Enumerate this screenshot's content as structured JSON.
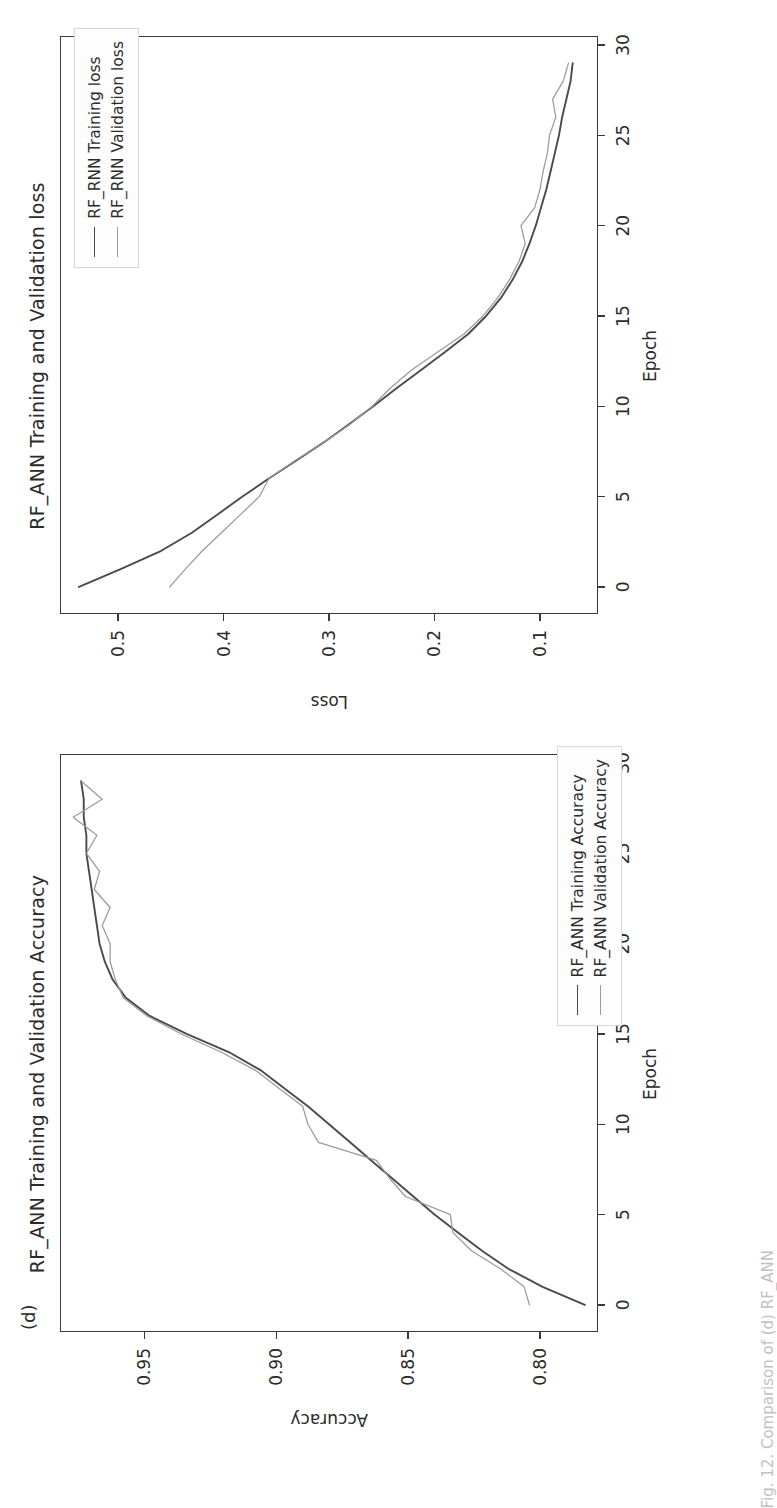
{
  "figure": {
    "subfigure_letter": "(d)",
    "caption_fragment": "Fig. 12. Comparison of (d) RF_ANN"
  },
  "colors": {
    "train": "#4a4a4a",
    "validation": "#9a9a9a",
    "axis": "#3a3a3a",
    "text": "#2b2b2b",
    "legend_border": "#d9d9d9",
    "background": "#ffffff"
  },
  "charts": [
    {
      "id": "loss",
      "title": "RF_ANN Training and Validation loss",
      "xlabel": "Epoch",
      "ylabel": "Loss",
      "xticks": [
        0,
        5,
        10,
        15,
        20,
        25,
        30
      ],
      "yticks": [
        0.5,
        0.4,
        0.3,
        0.2,
        0.1
      ],
      "legend": [
        {
          "label": "RF_RNN Training loss",
          "color": "#4a4a4a"
        },
        {
          "label": "RF_RNN Validation loss",
          "color": "#9a9a9a"
        }
      ]
    },
    {
      "id": "accuracy",
      "title": "RF_ANN Training and Validation Accuracy",
      "xlabel": "Epoch",
      "ylabel": "Accuracy",
      "xticks": [
        0,
        5,
        10,
        15,
        20,
        25,
        30
      ],
      "yticks": [
        0.95,
        0.9,
        0.85,
        0.8
      ],
      "legend": [
        {
          "label": "RF_ANN Training Accuracy",
          "color": "#4a4a4a"
        },
        {
          "label": "RF_ANN Validation Accuracy",
          "color": "#9a9a9a"
        }
      ]
    }
  ],
  "chart_data": [
    {
      "type": "line",
      "id": "loss",
      "title": "RF_ANN Training and Validation loss",
      "xlabel": "Epoch",
      "ylabel": "Loss",
      "xlim": [
        -1.5,
        30.5
      ],
      "ylim": [
        0.045,
        0.555
      ],
      "grid": false,
      "legend_position": "upper right",
      "x": [
        0,
        1,
        2,
        3,
        4,
        5,
        6,
        7,
        8,
        9,
        10,
        11,
        12,
        13,
        14,
        15,
        16,
        17,
        18,
        19,
        20,
        21,
        22,
        23,
        24,
        25,
        26,
        27,
        28,
        29
      ],
      "series": [
        {
          "name": "RF_RNN Training loss",
          "color": "#4a4a4a",
          "values": [
            0.537,
            0.497,
            0.459,
            0.43,
            0.406,
            0.382,
            0.357,
            0.331,
            0.305,
            0.281,
            0.258,
            0.236,
            0.213,
            0.19,
            0.168,
            0.151,
            0.137,
            0.126,
            0.117,
            0.11,
            0.104,
            0.099,
            0.094,
            0.09,
            0.086,
            0.082,
            0.079,
            0.075,
            0.071,
            0.069
          ]
        },
        {
          "name": "RF_RNN Validation loss",
          "color": "#9a9a9a",
          "values": [
            0.451,
            0.436,
            0.42,
            0.402,
            0.384,
            0.366,
            0.357,
            0.332,
            0.305,
            0.28,
            0.259,
            0.242,
            0.222,
            0.197,
            0.172,
            0.154,
            0.14,
            0.129,
            0.12,
            0.114,
            0.118,
            0.105,
            0.1,
            0.097,
            0.093,
            0.091,
            0.085,
            0.088,
            0.078,
            0.073
          ]
        }
      ]
    },
    {
      "type": "line",
      "id": "accuracy",
      "title": "RF_ANN Training and Validation Accuracy",
      "xlabel": "Epoch",
      "ylabel": "Accuracy",
      "xlim": [
        -1.5,
        30.5
      ],
      "ylim": [
        0.778,
        0.982
      ],
      "grid": false,
      "legend_position": "lower right",
      "x": [
        0,
        1,
        2,
        3,
        4,
        5,
        6,
        7,
        8,
        9,
        10,
        11,
        12,
        13,
        14,
        15,
        16,
        17,
        18,
        19,
        20,
        21,
        22,
        23,
        24,
        25,
        26,
        27,
        28,
        29
      ],
      "series": [
        {
          "name": "RF_ANN Training Accuracy",
          "color": "#4a4a4a",
          "values": [
            0.783,
            0.799,
            0.812,
            0.822,
            0.831,
            0.84,
            0.848,
            0.856,
            0.864,
            0.872,
            0.88,
            0.888,
            0.897,
            0.906,
            0.918,
            0.934,
            0.948,
            0.957,
            0.962,
            0.965,
            0.967,
            0.968,
            0.969,
            0.97,
            0.971,
            0.972,
            0.972,
            0.973,
            0.973,
            0.974
          ]
        },
        {
          "name": "RF_ANN Validation Accuracy",
          "color": "#9a9a9a",
          "values": [
            0.804,
            0.806,
            0.815,
            0.826,
            0.833,
            0.834,
            0.851,
            0.857,
            0.862,
            0.884,
            0.888,
            0.89,
            0.899,
            0.908,
            0.921,
            0.936,
            0.949,
            0.958,
            0.961,
            0.963,
            0.963,
            0.966,
            0.963,
            0.969,
            0.967,
            0.972,
            0.968,
            0.977,
            0.966,
            0.974
          ]
        }
      ]
    }
  ]
}
